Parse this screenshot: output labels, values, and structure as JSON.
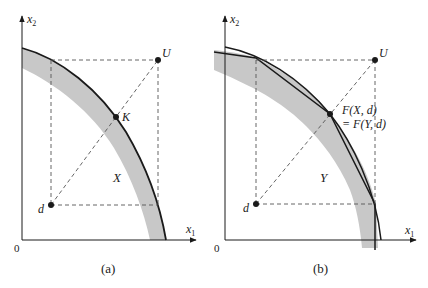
{
  "figure": {
    "panels": [
      {
        "id": "a",
        "caption": "(a)",
        "axis_x_label": "x",
        "axis_x_sub": "1",
        "axis_y_label": "x",
        "axis_y_sub": "2",
        "origin_label": "0",
        "points": {
          "U": "U",
          "K": "K",
          "d": "d"
        },
        "region_label": "X"
      },
      {
        "id": "b",
        "caption": "(b)",
        "axis_x_label": "x",
        "axis_x_sub": "1",
        "axis_y_label": "x",
        "axis_y_sub": "2",
        "origin_label": "0",
        "points": {
          "U": "U",
          "d": "d",
          "F_line1": "F(X, d)",
          "F_line2": "= F(Y, d)"
        },
        "region_label": "Y"
      }
    ],
    "colors": {
      "ink": "#1a1a1a",
      "shade": "#c8c8c8",
      "dash": "#555555"
    }
  }
}
